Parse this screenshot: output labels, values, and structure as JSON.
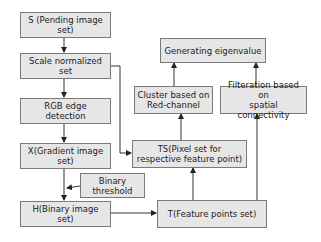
{
  "diagram": {
    "nodes": {
      "s": "S (Pending image set)",
      "scale": "Scale normalized set",
      "rgb": "RGB edge detection",
      "x": "X(Gradient image set)",
      "binary_threshold": "Binary threshold",
      "h": "H(Binary image set)",
      "t": "T(Feature points set)",
      "ts": "TS(Pixel set for\nrespective feature point)",
      "cluster": "Cluster based on\nRed-channel",
      "filter": "Filteration based on\nspatial connectivity",
      "eigen": "Generating eigenvalue"
    },
    "edges": [
      {
        "from": "S (Pending image set)",
        "to": "Scale normalized set"
      },
      {
        "from": "Scale normalized set",
        "to": "RGB edge detection"
      },
      {
        "from": "Scale normalized set",
        "to": "TS(Pixel set for respective feature point)"
      },
      {
        "from": "RGB edge detection",
        "to": "X(Gradient image set)"
      },
      {
        "from": "X(Gradient image set)",
        "to": "H(Binary image set)"
      },
      {
        "from": "Binary threshold",
        "to": "X-H edge"
      },
      {
        "from": "H(Binary image set)",
        "to": "T(Feature points set)"
      },
      {
        "from": "T(Feature points set)",
        "to": "TS(Pixel set for respective feature point)"
      },
      {
        "from": "T(Feature points set)",
        "to": "Filteration based on spatial connectivity"
      },
      {
        "from": "TS(Pixel set for respective feature point)",
        "to": "Cluster based on Red-channel"
      },
      {
        "from": "Cluster based on Red-channel",
        "to": "Generating eigenvalue"
      },
      {
        "from": "Filteration based on spatial connectivity",
        "to": "Generating eigenvalue"
      }
    ],
    "colors": {
      "box_fill": "#e6e6e6",
      "box_border": "#7a7a7a",
      "line": "#333333"
    }
  }
}
